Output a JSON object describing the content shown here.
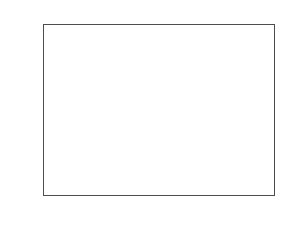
{
  "chart_data": {
    "type": "line",
    "plot_style": "stem",
    "title": "",
    "xlabel": "k",
    "ylabel": "f(k)",
    "xlim": [
      0,
      50
    ],
    "ylim": [
      -1,
      1
    ],
    "grid": false,
    "legend": null,
    "xticks": [
      0,
      10,
      20,
      30,
      40,
      50
    ],
    "xtick_labels": [
      "0",
      "10",
      "20",
      "30",
      "40",
      "50"
    ],
    "yticks": [
      -1,
      -0.8,
      -0.6,
      -0.4,
      -0.2,
      0,
      0.2,
      0.4,
      0.6,
      0.8,
      1
    ],
    "ytick_labels": [
      "-1",
      "-0.8",
      "-0.6",
      "-0.4",
      "-0.2",
      "0",
      "0.2",
      "0.4",
      "0.6",
      "0.8",
      "1"
    ],
    "marker": "open-circle",
    "series": [
      {
        "name": "f(k)",
        "x": [
          0,
          1,
          2,
          3,
          4,
          5,
          6,
          7,
          8,
          9,
          10,
          11,
          12,
          13,
          14,
          15,
          16,
          17,
          18,
          19,
          20,
          21,
          22,
          23,
          24,
          25,
          26,
          27,
          28,
          29,
          30,
          31,
          32,
          33,
          34,
          35,
          36,
          37,
          38,
          39,
          40,
          41,
          42,
          43,
          44,
          45,
          46,
          47,
          48,
          49,
          50
        ],
        "values": [
          0,
          0.2,
          0.6,
          0.8,
          0.8,
          0.6,
          0.4,
          0.2,
          0,
          -0.4,
          -0.6,
          -0.8,
          -0.8,
          -0.8,
          -0.6,
          -0.4,
          -0.2,
          0.2,
          0.4,
          0.4,
          0.4,
          0.4,
          0.2,
          0,
          0,
          -0.2,
          -0.4,
          -0.6,
          -0.6,
          -0.4,
          -0.2,
          -0.2,
          0,
          0,
          0.2,
          0.2,
          0.2,
          0.2,
          0.2,
          0,
          0,
          -0.2,
          -0.4,
          -0.4,
          -0.4,
          -0.4,
          -0.2,
          -0.2,
          -0.2,
          0,
          0
        ]
      }
    ],
    "colors": {
      "axis": "#4d4d4d",
      "stem": "#808080",
      "marker_edge": "#555555",
      "background": "#ffffff"
    }
  }
}
